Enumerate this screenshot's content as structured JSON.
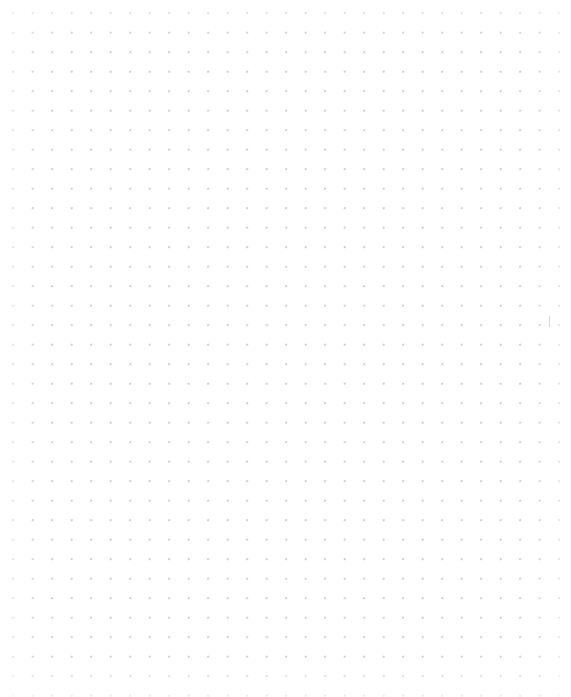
{
  "page": {
    "width": 571,
    "height": 697,
    "background_color": "#ffffff"
  },
  "grid": {
    "type": "dot-grid",
    "dot_color": "#c8c8cd",
    "dot_radius_px": 0.75,
    "spacing_x_px": 19.5,
    "spacing_y_px": 19.5,
    "origin_x_px": 13,
    "origin_y_px": 13,
    "columns": 29,
    "rows": 36
  },
  "artifacts": {
    "caret": {
      "name": "text-caret",
      "x_px": 549,
      "y_px": 316,
      "width_px": 1,
      "height_px": 11,
      "color": "#b9b9bf"
    }
  },
  "content": {
    "text_items": [],
    "empty_state_label": ""
  }
}
